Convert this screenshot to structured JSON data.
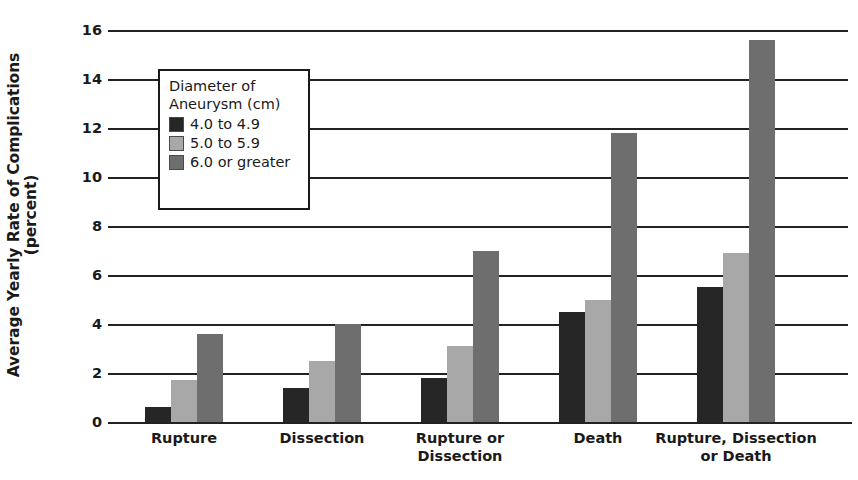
{
  "chart_data": {
    "type": "bar",
    "title": "",
    "xlabel": "",
    "ylabel": "Average Yearly Rate of Complications (percent)",
    "ylabel_lines": [
      "Average Yearly Rate of Complications",
      "(percent)"
    ],
    "ylim": [
      0,
      16
    ],
    "ytick_labels": [
      "16",
      "14",
      "12",
      "10",
      "8",
      "6",
      "4",
      "2",
      "0"
    ],
    "ytick_values": [
      16,
      14,
      12,
      10,
      8,
      6,
      4,
      2,
      0
    ],
    "grid": true,
    "grid_axis": "y",
    "legend_position": "upper-left-inside",
    "legend_title_lines": [
      "Diameter of",
      "Aneurysm (cm)"
    ],
    "categories": [
      "Rupture",
      "Dissection",
      "Rupture or Dissection",
      "Death",
      "Rupture, Dissection or Death"
    ],
    "category_label_lines": [
      [
        "Rupture"
      ],
      [
        "Dissection"
      ],
      [
        "Rupture or",
        "Dissection"
      ],
      [
        "Death"
      ],
      [
        "Rupture, Dissection",
        "or Death"
      ]
    ],
    "series": [
      {
        "name": "4.0 to 4.9",
        "color": "#262626",
        "values": [
          0.6,
          1.4,
          1.8,
          4.5,
          5.5
        ]
      },
      {
        "name": "5.0 to 5.9",
        "color": "#a8a8a8",
        "values": [
          1.7,
          2.5,
          3.1,
          5.0,
          6.9
        ]
      },
      {
        "name": "6.0 or greater",
        "color": "#6e6e6e",
        "values": [
          3.6,
          4.0,
          7.0,
          11.8,
          15.6
        ]
      }
    ]
  },
  "colors": {
    "axis": "#222222",
    "text": "#1a1a1a",
    "background": "#ffffff",
    "series_1": "#262626",
    "series_2": "#a8a8a8",
    "series_3": "#6e6e6e"
  }
}
